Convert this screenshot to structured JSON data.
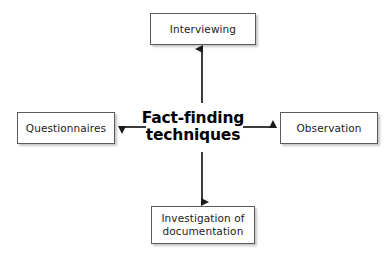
{
  "diagram": {
    "title": "Fact-finding techniques",
    "canvas": {
      "width": 386,
      "height": 256,
      "background": "#ffffff"
    },
    "center": {
      "line1": "Fact-finding",
      "line2": "techniques",
      "color": "#000000"
    },
    "nodes": [
      {
        "id": "interviewing",
        "label": "Interviewing",
        "position": "top",
        "border_color": "#5a5a5a",
        "fill": "#ffffff"
      },
      {
        "id": "questionnaires",
        "label": "Questionnaires",
        "position": "left",
        "border_color": "#5a5a5a",
        "fill": "#ffffff"
      },
      {
        "id": "observation",
        "label": "Observation",
        "position": "right",
        "border_color": "#5a5a5a",
        "fill": "#ffffff"
      },
      {
        "id": "investigation-of-documentation",
        "label": "Investigation of\ndocumentation",
        "position": "bottom",
        "border_color": "#5a5a5a",
        "fill": "#ffffff"
      }
    ],
    "connectors": [
      {
        "id": "arrow-up",
        "from": "center",
        "to": "interviewing",
        "direction": "up",
        "color": "#1a1a1a"
      },
      {
        "id": "arrow-left",
        "from": "center",
        "to": "questionnaires",
        "direction": "left",
        "color": "#1a1a1a"
      },
      {
        "id": "arrow-right",
        "from": "center",
        "to": "observation",
        "direction": "right",
        "color": "#1a1a1a"
      },
      {
        "id": "arrow-down",
        "from": "center",
        "to": "investigation-of-documentation",
        "direction": "down",
        "color": "#1a1a1a"
      }
    ]
  }
}
